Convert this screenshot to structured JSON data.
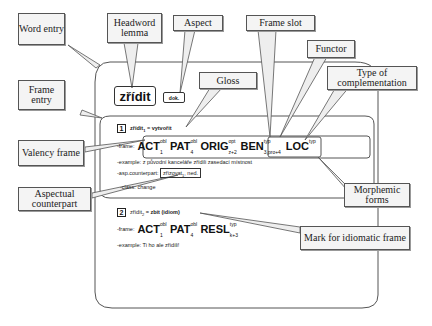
{
  "callouts": {
    "word_entry": "Word entry",
    "headword_lemma": "Headword lemma",
    "aspect": "Aspect",
    "frame_slot": "Frame slot",
    "functor": "Functor",
    "type_of_complementation": "Type of complementation",
    "gloss": "Gloss",
    "frame_entry": "Frame entry",
    "valency_frame": "Valency frame",
    "aspectual_counterpart": "Aspectual counterpart",
    "morphemic_forms": "Morphemic forms",
    "mark_for_idiomatic_frame": "Mark for idiomatic frame"
  },
  "word_entry": {
    "lemma": "zřídit",
    "aspect": "dok.",
    "frames": [
      {
        "number": "1",
        "head": "zřídit",
        "head_sub": "1",
        "gloss": "= vytvořit",
        "frame_label": "-frame:",
        "slots": [
          {
            "functor": "ACT",
            "sup": "obl",
            "sub": "1"
          },
          {
            "functor": "PAT",
            "sup": "obl",
            "sub": "4"
          },
          {
            "functor": "ORIG",
            "sup": "opt",
            "sub": "z+2"
          },
          {
            "functor": "BEN",
            "sup": "typ",
            "sub": "3,pro+4"
          },
          {
            "functor": "LOC",
            "sup": "typ",
            "sub": ""
          }
        ],
        "example": "-example: z původní kanceláře zřídili zasedací místnost",
        "asp_label": "-asp.counterpart:",
        "asp_value": "zřizovat",
        "asp_sub": "1",
        "asp_aspect": "ned.",
        "class": "-class: change"
      },
      {
        "number": "2",
        "head": "zřídit",
        "head_sub": "2",
        "gloss": "= zbít (idiom)",
        "frame_label": "-frame:",
        "slots": [
          {
            "functor": "ACT",
            "sup": "obl",
            "sub": "1"
          },
          {
            "functor": "PAT",
            "sup": "obl",
            "sub": "4"
          },
          {
            "functor": "RESL",
            "sup": "typ",
            "sub": "k+3"
          }
        ],
        "example": "-example: Ti ho ale zřídili!"
      }
    ]
  }
}
